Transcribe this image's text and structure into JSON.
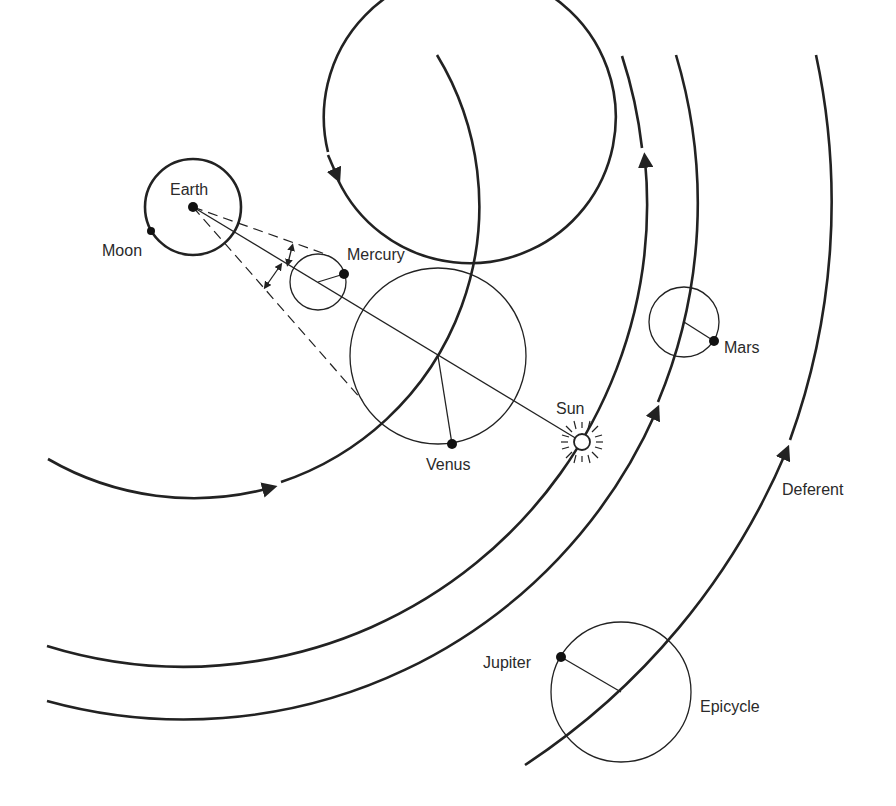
{
  "labels": {
    "earth": "Earth",
    "moon": "Moon",
    "mercury": "Mercury",
    "venus": "Venus",
    "sun": "Sun",
    "mars": "Mars",
    "jupiter": "Jupiter",
    "deferent": "Deferent",
    "epicycle": "Epicycle"
  },
  "bodies": [
    {
      "name": "Earth",
      "x": 193,
      "y": 207
    },
    {
      "name": "Moon",
      "x": 151,
      "y": 231
    },
    {
      "name": "Mercury",
      "x": 344,
      "y": 274
    },
    {
      "name": "Venus",
      "x": 452,
      "y": 444
    },
    {
      "name": "Sun",
      "x": 582,
      "y": 442
    },
    {
      "name": "Mars",
      "x": 714,
      "y": 341
    },
    {
      "name": "Jupiter",
      "x": 561,
      "y": 657
    }
  ],
  "colors": {
    "ink": "#222222",
    "background": "#ffffff"
  }
}
